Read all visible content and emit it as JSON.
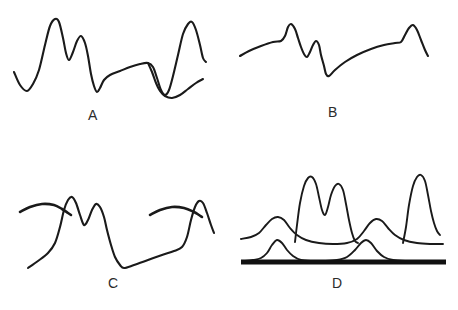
{
  "figure": {
    "background_color": "#ffffff",
    "stroke_color": "#1a1a1a",
    "baseline_color": "#111111",
    "panel_count": 4,
    "layout": "2x2 grid"
  },
  "panels": [
    {
      "id": "a",
      "label": "A",
      "description": "single continuous self-crossing waveform with two tall left peaks, a broad low middle plateau, and a tall right peak",
      "curve_points": [
        [
          14,
          72
        ],
        [
          20,
          85
        ],
        [
          27,
          91
        ],
        [
          33,
          84
        ],
        [
          39,
          70
        ],
        [
          45,
          45
        ],
        [
          50,
          26
        ],
        [
          55,
          19
        ],
        [
          59,
          22
        ],
        [
          63,
          38
        ],
        [
          66,
          53
        ],
        [
          69,
          60
        ],
        [
          73,
          52
        ],
        [
          77,
          41
        ],
        [
          81,
          36
        ],
        [
          85,
          43
        ],
        [
          88,
          56
        ],
        [
          91,
          74
        ],
        [
          94,
          86
        ],
        [
          97,
          92
        ],
        [
          100,
          88
        ],
        [
          104,
          80
        ],
        [
          110,
          75
        ],
        [
          120,
          71
        ],
        [
          130,
          67
        ],
        [
          140,
          64
        ],
        [
          148,
          63
        ],
        [
          153,
          67
        ],
        [
          157,
          78
        ],
        [
          161,
          90
        ],
        [
          165,
          95
        ],
        [
          169,
          90
        ],
        [
          173,
          76
        ],
        [
          178,
          55
        ],
        [
          183,
          34
        ],
        [
          188,
          24
        ],
        [
          192,
          22
        ],
        [
          196,
          30
        ],
        [
          200,
          45
        ],
        [
          203,
          58
        ],
        [
          206,
          62
        ]
      ],
      "tail_points": [
        [
          148,
          63
        ],
        [
          152,
          72
        ],
        [
          156,
          83
        ],
        [
          160,
          91
        ],
        [
          165,
          96
        ],
        [
          172,
          98
        ],
        [
          180,
          95
        ],
        [
          188,
          89
        ],
        [
          196,
          83
        ],
        [
          203,
          79
        ]
      ]
    },
    {
      "id": "b",
      "label": "B",
      "description": "gently rising baseline with one sharp peak, a smaller secondary peak, a deep V notch, a long rising ramp and a final sharp peak",
      "curve_points": [
        [
          11,
          56
        ],
        [
          20,
          51
        ],
        [
          32,
          46
        ],
        [
          44,
          42
        ],
        [
          52,
          41
        ],
        [
          56,
          36
        ],
        [
          59,
          27
        ],
        [
          62,
          24
        ],
        [
          66,
          29
        ],
        [
          69,
          38
        ],
        [
          72,
          47
        ],
        [
          75,
          54
        ],
        [
          78,
          57
        ],
        [
          81,
          52
        ],
        [
          84,
          45
        ],
        [
          87,
          41
        ],
        [
          90,
          45
        ],
        [
          92,
          55
        ],
        [
          95,
          66
        ],
        [
          97,
          74
        ],
        [
          100,
          76
        ],
        [
          106,
          70
        ],
        [
          116,
          62
        ],
        [
          128,
          55
        ],
        [
          142,
          49
        ],
        [
          155,
          45
        ],
        [
          166,
          43
        ],
        [
          172,
          42
        ],
        [
          176,
          35
        ],
        [
          180,
          28
        ],
        [
          184,
          25
        ],
        [
          188,
          30
        ],
        [
          192,
          40
        ],
        [
          196,
          50
        ],
        [
          199,
          56
        ]
      ]
    },
    {
      "id": "c",
      "label": "C",
      "description": "central jagged waveform with two arc strokes crossing it on the left and right",
      "main_points": [
        [
          28,
          113
        ],
        [
          38,
          106
        ],
        [
          48,
          98
        ],
        [
          55,
          88
        ],
        [
          60,
          72
        ],
        [
          64,
          55
        ],
        [
          68,
          45
        ],
        [
          72,
          42
        ],
        [
          76,
          48
        ],
        [
          80,
          60
        ],
        [
          84,
          70
        ],
        [
          88,
          65
        ],
        [
          92,
          55
        ],
        [
          96,
          49
        ],
        [
          100,
          52
        ],
        [
          104,
          62
        ],
        [
          107,
          75
        ],
        [
          111,
          90
        ],
        [
          115,
          102
        ],
        [
          120,
          110
        ],
        [
          124,
          113
        ],
        [
          134,
          110
        ],
        [
          148,
          105
        ],
        [
          162,
          100
        ],
        [
          174,
          96
        ],
        [
          182,
          92
        ],
        [
          187,
          82
        ],
        [
          191,
          65
        ],
        [
          195,
          52
        ],
        [
          199,
          46
        ],
        [
          203,
          48
        ],
        [
          207,
          58
        ],
        [
          211,
          70
        ],
        [
          214,
          78
        ]
      ],
      "left_arc_points": [
        [
          20,
          57
        ],
        [
          30,
          52
        ],
        [
          42,
          49
        ],
        [
          54,
          50
        ],
        [
          62,
          54
        ],
        [
          68,
          58
        ],
        [
          71,
          60
        ]
      ],
      "right_arc_points": [
        [
          150,
          60
        ],
        [
          160,
          55
        ],
        [
          172,
          52
        ],
        [
          184,
          53
        ],
        [
          194,
          57
        ],
        [
          199,
          60
        ],
        [
          202,
          62
        ]
      ]
    },
    {
      "id": "d",
      "label": "D",
      "description": "thick horizontal baseline, a low smooth two-bump curve above it, and an upper curve with two broad bumps overlaid by a tall twin-peak spike and a tall right spike",
      "baseline": {
        "x1": 12,
        "y1": 107,
        "x2": 217,
        "y2": 107
      },
      "lower_curve_points": [
        [
          14,
          106
        ],
        [
          24,
          105
        ],
        [
          32,
          103
        ],
        [
          38,
          98
        ],
        [
          43,
          90
        ],
        [
          48,
          85
        ],
        [
          53,
          88
        ],
        [
          58,
          95
        ],
        [
          64,
          101
        ],
        [
          72,
          105
        ],
        [
          84,
          106
        ],
        [
          96,
          106
        ],
        [
          108,
          105
        ],
        [
          118,
          102
        ],
        [
          126,
          95
        ],
        [
          132,
          88
        ],
        [
          137,
          85
        ],
        [
          142,
          88
        ],
        [
          148,
          96
        ],
        [
          155,
          102
        ],
        [
          164,
          105
        ],
        [
          176,
          106
        ],
        [
          192,
          106
        ],
        [
          210,
          106
        ]
      ],
      "upper_curve_points": [
        [
          12,
          84
        ],
        [
          22,
          82
        ],
        [
          30,
          78
        ],
        [
          37,
          70
        ],
        [
          43,
          64
        ],
        [
          49,
          62
        ],
        [
          55,
          65
        ],
        [
          61,
          73
        ],
        [
          68,
          80
        ],
        [
          77,
          85
        ],
        [
          90,
          88
        ],
        [
          104,
          89
        ],
        [
          118,
          88
        ],
        [
          128,
          84
        ],
        [
          135,
          76
        ],
        [
          141,
          68
        ],
        [
          147,
          64
        ],
        [
          153,
          66
        ],
        [
          159,
          73
        ],
        [
          166,
          80
        ],
        [
          175,
          85
        ],
        [
          188,
          88
        ],
        [
          202,
          89
        ],
        [
          214,
          89
        ]
      ],
      "twin_spike_points": [
        [
          66,
          87
        ],
        [
          68,
          70
        ],
        [
          71,
          48
        ],
        [
          75,
          31
        ],
        [
          79,
          23
        ],
        [
          83,
          22
        ],
        [
          87,
          29
        ],
        [
          90,
          42
        ],
        [
          93,
          55
        ],
        [
          96,
          60
        ],
        [
          99,
          52
        ],
        [
          102,
          40
        ],
        [
          106,
          31
        ],
        [
          110,
          29
        ],
        [
          114,
          35
        ],
        [
          117,
          49
        ],
        [
          120,
          65
        ],
        [
          123,
          78
        ],
        [
          126,
          86
        ],
        [
          129,
          88
        ]
      ],
      "right_spike_points": [
        [
          174,
          88
        ],
        [
          177,
          72
        ],
        [
          180,
          50
        ],
        [
          184,
          31
        ],
        [
          188,
          22
        ],
        [
          192,
          20
        ],
        [
          196,
          26
        ],
        [
          199,
          40
        ],
        [
          202,
          56
        ],
        [
          205,
          68
        ],
        [
          208,
          76
        ],
        [
          211,
          80
        ]
      ]
    }
  ]
}
